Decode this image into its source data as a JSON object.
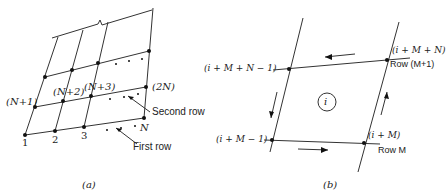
{
  "panel_a": {
    "caption": "(a)",
    "node_labels": {
      "n1": "1",
      "n2": "2",
      "n3": "3",
      "nN": "N",
      "nN1": "(N+1)",
      "nN2": "(N+2)",
      "nN3": "(N+3)",
      "n2N": "(2N)"
    },
    "annotations": {
      "second_row": "Second row",
      "first_row": "First row"
    }
  },
  "panel_b": {
    "caption": "(b)",
    "node_labels": {
      "top_left": "(i + M + N − 1)",
      "top_right": "(i + M + N)",
      "bottom_left": "(i + M − 1)",
      "bottom_right": "(i + M)"
    },
    "row_labels": {
      "top": "Row (M+1)",
      "bottom": "Row M"
    },
    "element_label": "i"
  }
}
